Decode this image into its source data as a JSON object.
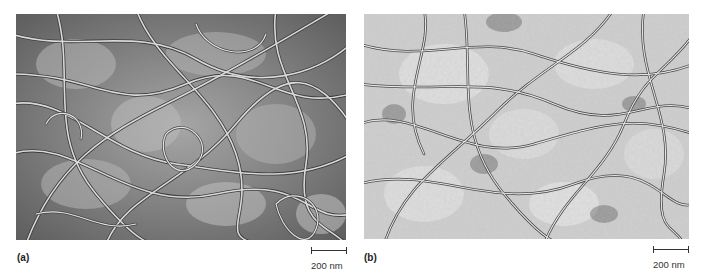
{
  "figure": {
    "panels": [
      {
        "label": "(a)",
        "description": "Electron micrograph of dense network of long fibrils, darker background",
        "scale_bar": "200 nm",
        "tone": {
          "background": "#8a8a8a",
          "fibril_light": "#d8d8d8",
          "fibril_dark": "#3a3a3a"
        }
      },
      {
        "label": "(b)",
        "description": "Electron micrograph of fibril network, lighter speckled background",
        "scale_bar": "200 nm",
        "tone": {
          "background": "#cfcfcf",
          "fibril_light": "#f0f0f0",
          "fibril_dark": "#2e2e2e"
        }
      }
    ]
  }
}
